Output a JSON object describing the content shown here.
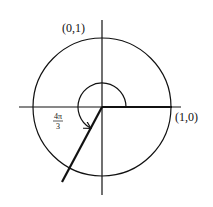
{
  "diagram": {
    "type": "unit-circle-angle",
    "labels": {
      "top_point": "(0,1)",
      "right_point": "(1,0)",
      "angle_numerator": "4π",
      "angle_denominator": "3"
    },
    "angle_radians": 4.18879,
    "angle_label": "4π/3",
    "colors": {
      "stroke": "#111111",
      "background": "#ffffff"
    }
  }
}
